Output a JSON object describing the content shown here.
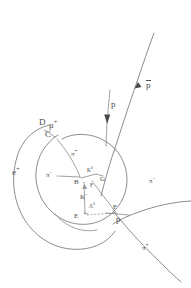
{
  "figure": {
    "kind": "bubble-chamber-track-diagram",
    "background_color": "#ffffff",
    "track_color": "#6e6e6e",
    "label_color": "#4c4c4c",
    "width": 191,
    "height": 288
  },
  "labels": {
    "e_plus": "e",
    "e_plus_sup": "+",
    "mu_plus": "μ",
    "mu_plus_sup": "+",
    "pi_plus_inner": "π",
    "pi_plus_inner_sup": "+",
    "pi_minus_inner": "π",
    "pi_minus_inner_sup": "−",
    "pi_minus_right": "π",
    "pi_minus_right_sup": "−",
    "pi_plus_bottom": "π",
    "pi_plus_bottom_sup": "+",
    "k_zero": "K",
    "k_zero_sup": "0",
    "k_minus": "K",
    "k_minus_sup": "−",
    "lambda_zero": "Λ",
    "lambda_zero_sup": "0",
    "proton": "p",
    "proton_f": "p",
    "antiproton": "p",
    "vertex_a": "A",
    "vertex_b": "B",
    "vertex_c": "C",
    "vertex_d": "D",
    "vertex_e": "E",
    "vertex_f": "F",
    "vertex_g": "G",
    "vertex_f_inner": "F"
  },
  "icons": {
    "arrow_down_proton": "arrow-down-icon",
    "arrow_up_antiproton": "arrow-up-icon"
  }
}
